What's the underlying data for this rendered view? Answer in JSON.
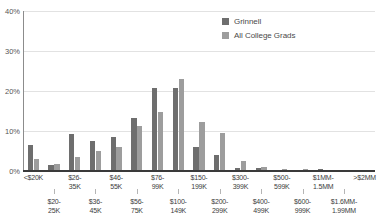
{
  "chart_data": {
    "type": "bar",
    "title": "",
    "subtitle": "",
    "xlabel": "",
    "ylabel": "",
    "ylim": [
      0,
      40
    ],
    "yticks": [
      0,
      10,
      20,
      30,
      40
    ],
    "ytick_labels": [
      "0%",
      "10%",
      "20%",
      "30%",
      "40%"
    ],
    "grid": true,
    "legend_position": "top-right",
    "categories": [
      "<$20K",
      "$20-25K",
      "$26-35K",
      "$36-45K",
      "$46-55K",
      "$56-75K",
      "$76-99K",
      "$100-149K",
      "$150-199K",
      "$200-299K",
      "$300-399K",
      "$400-499K",
      "$500-599K",
      "$600-999K",
      "$1MM-1.5MM",
      "$1.6MM-1.99MM",
      ">$2MM"
    ],
    "category_lines": [
      [
        "<$20K"
      ],
      [
        "$20-",
        "25K"
      ],
      [
        "$26-",
        "35K"
      ],
      [
        "$36-",
        "45K"
      ],
      [
        "$46-",
        "55K"
      ],
      [
        "$56-",
        "75K"
      ],
      [
        "$76-",
        "99K"
      ],
      [
        "$100-",
        "149K"
      ],
      [
        "$150-",
        "199K"
      ],
      [
        "$200-",
        "299K"
      ],
      [
        "$300-",
        "399K"
      ],
      [
        "$400-",
        "499K"
      ],
      [
        "$500-",
        "599K"
      ],
      [
        "$600-",
        "999K"
      ],
      [
        "$1MM-",
        "1.5MM"
      ],
      [
        "$1.6MM-",
        "1.99MM"
      ],
      [
        ">$2MM"
      ]
    ],
    "series": [
      {
        "name": "Grinnell",
        "color": "#6e6e6e",
        "values": [
          6.6,
          1.6,
          9.2,
          7.4,
          8.4,
          13.3,
          20.7,
          20.7,
          5.9,
          4.1,
          0.7,
          0.8,
          0.2,
          0.2,
          0.5,
          0.0,
          0.0
        ]
      },
      {
        "name": "All College Grads",
        "color": "#9d9d9d",
        "values": [
          2.9,
          1.7,
          3.6,
          4.9,
          6.0,
          11.2,
          14.7,
          22.9,
          12.2,
          9.5,
          2.5,
          1.0,
          0.6,
          0.5,
          0.3,
          0.0,
          0.3
        ]
      }
    ]
  },
  "legend": {
    "items": [
      {
        "label": "Grinnell",
        "color": "#6e6e6e"
      },
      {
        "label": "All College Grads",
        "color": "#9d9d9d"
      }
    ]
  }
}
